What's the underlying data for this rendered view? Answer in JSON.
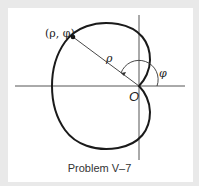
{
  "diagram": {
    "point_label": "(ρ, φ)",
    "radius_label": "ρ",
    "angle_label": "φ",
    "origin_label": "O",
    "caption": "Problem V–7",
    "curve": "cardioid ρ = a(1 − cos φ)",
    "colors": {
      "background": "#e9e9e9",
      "panel": "#ffffff",
      "curve": "#1a1a1a",
      "axes": "#555555"
    }
  }
}
